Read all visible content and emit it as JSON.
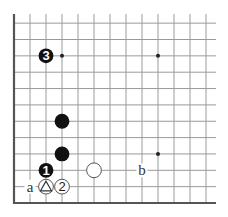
{
  "diagram": {
    "type": "go-board-corner",
    "title": "",
    "grid": {
      "origin_x": 14,
      "origin_y": 203,
      "spacing_x": 16,
      "spacing_y": 16.35,
      "columns": 13,
      "rows": 12,
      "top_extent_y": 14,
      "right_extent_x": 216,
      "line_color": "#9a9a9a",
      "edge_color": "#555555"
    },
    "star_points": [
      {
        "col": 3,
        "row": 9
      },
      {
        "col": 9,
        "row": 9
      },
      {
        "col": 9,
        "row": 3
      }
    ],
    "stones": [
      {
        "id": "black-3",
        "color": "black",
        "col": 2,
        "row": 9,
        "label": "3",
        "marker": ""
      },
      {
        "id": "black-a",
        "color": "black",
        "col": 3,
        "row": 5,
        "label": "",
        "marker": ""
      },
      {
        "id": "black-b",
        "color": "black",
        "col": 3,
        "row": 3,
        "label": "",
        "marker": ""
      },
      {
        "id": "black-1",
        "color": "black",
        "col": 2,
        "row": 2,
        "label": "1",
        "marker": ""
      },
      {
        "id": "white-triangle",
        "color": "white",
        "col": 2,
        "row": 1,
        "label": "",
        "marker": "triangle"
      },
      {
        "id": "white-2",
        "color": "white",
        "col": 3,
        "row": 1,
        "label": "2",
        "marker": ""
      },
      {
        "id": "white-plain",
        "color": "white",
        "col": 5,
        "row": 2,
        "label": "",
        "marker": ""
      }
    ],
    "labels": [
      {
        "id": "label-a",
        "text": "a",
        "col": 1,
        "row": 1
      },
      {
        "id": "label-b",
        "text": "b",
        "col": 8,
        "row": 2
      }
    ],
    "colors": {
      "black_stone": "#111111",
      "white_stone_fill": "#ffffff",
      "white_stone_stroke": "#555555",
      "label_text": "#333333"
    }
  }
}
